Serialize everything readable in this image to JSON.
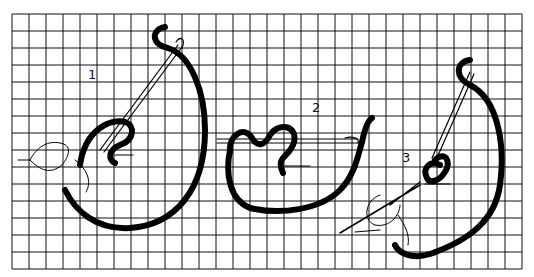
{
  "diagram": {
    "grid": {
      "x0": 12,
      "y0": 14,
      "cell": 17,
      "cols": 30,
      "rows": 15,
      "color": "#111111"
    },
    "steps": [
      {
        "label": "1",
        "x": 88,
        "y": 79
      },
      {
        "label": "2",
        "x": 312,
        "y": 112
      },
      {
        "label": "3",
        "x": 402,
        "y": 162
      }
    ]
  }
}
